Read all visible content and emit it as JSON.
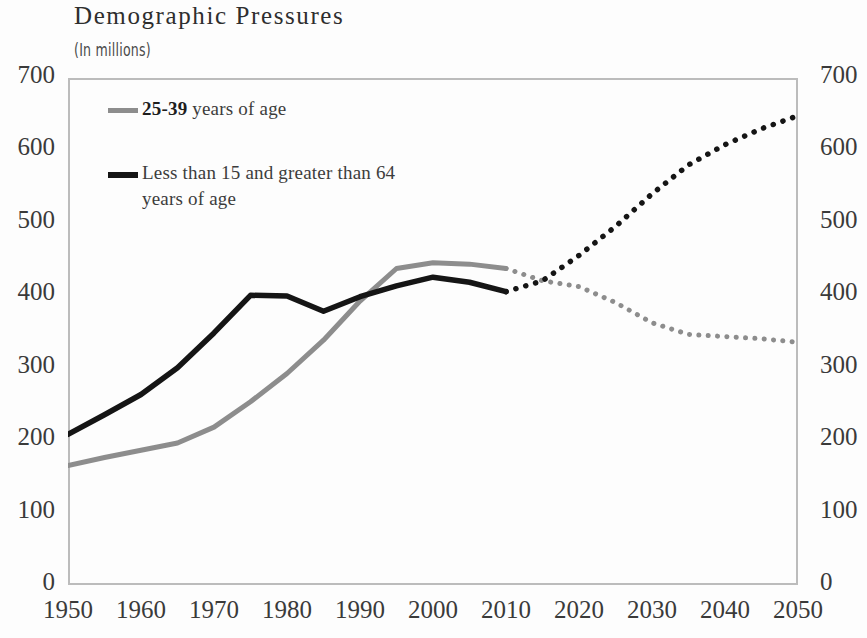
{
  "chart_data": {
    "type": "line",
    "title": "Demographic Pressures",
    "subtitle": "(In millions)",
    "xlabel": "",
    "ylabel": "",
    "xlim": [
      1950,
      2050
    ],
    "ylim": [
      0,
      700
    ],
    "ytick_labels": [
      "700",
      "600",
      "500",
      "400",
      "300",
      "200",
      "100",
      "0"
    ],
    "ytick_values": [
      700,
      600,
      500,
      400,
      300,
      200,
      100,
      0
    ],
    "xtick_labels": [
      "1950",
      "1960",
      "1970",
      "1980",
      "1990",
      "2000",
      "2010",
      "2020",
      "2030",
      "2040",
      "2050"
    ],
    "xtick_values": [
      1950,
      1960,
      1970,
      1980,
      1990,
      2000,
      2010,
      2020,
      2030,
      2040,
      2050
    ],
    "grid": false,
    "dual_y_axis": true,
    "projection_start_year": 2010,
    "legend_position": "upper-left-inside",
    "series": [
      {
        "name": "25-39 years of age",
        "color": "#8d8d8d",
        "x": [
          1950,
          1955,
          1960,
          1965,
          1970,
          1975,
          1980,
          1985,
          1990,
          1995,
          2000,
          2005,
          2010,
          2015,
          2020,
          2025,
          2030,
          2035,
          2040,
          2045,
          2050
        ],
        "values": [
          165,
          176,
          186,
          196,
          218,
          253,
          292,
          338,
          392,
          437,
          445,
          443,
          437,
          420,
          412,
          390,
          362,
          346,
          343,
          340,
          335
        ]
      },
      {
        "name": "Less than 15 and greater than 64 years of age",
        "color": "#151515",
        "x": [
          1950,
          1955,
          1960,
          1965,
          1970,
          1975,
          1980,
          1985,
          1990,
          1995,
          2000,
          2005,
          2010,
          2015,
          2020,
          2025,
          2030,
          2035,
          2040,
          2045,
          2050
        ],
        "values": [
          208,
          235,
          263,
          300,
          348,
          400,
          399,
          378,
          398,
          413,
          425,
          418,
          405,
          420,
          455,
          495,
          540,
          580,
          608,
          630,
          648
        ]
      }
    ]
  },
  "legend": {
    "entries": [
      {
        "bold_text": "25-39",
        "rest_text": " years of age",
        "swatch": "gray-line-swatch"
      },
      {
        "bold_text": "",
        "rest_text": "Less than 15 and greater than 64\nyears of age",
        "swatch": "black-line-swatch"
      }
    ]
  }
}
